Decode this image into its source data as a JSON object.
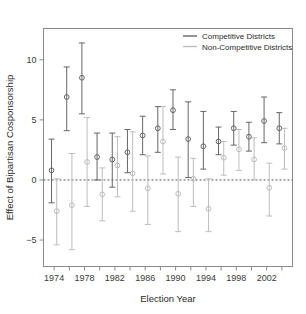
{
  "chart_data": {
    "type": "scatter",
    "title": "",
    "xlabel": "Election Year",
    "ylabel": "Effect of Bipartisan Cosponsorship",
    "xlim": [
      1972.6,
      2005.4
    ],
    "ylim": [
      -7.2,
      12.6
    ],
    "xticks": [
      1974,
      1976,
      1978,
      1980,
      1982,
      1984,
      1986,
      1988,
      1990,
      1992,
      1994,
      1996,
      1998,
      2000,
      2002,
      2004
    ],
    "xtick_labels": [
      "1974",
      "",
      "1978",
      "",
      "1982",
      "",
      "1986",
      "",
      "1990",
      "",
      "1994",
      "",
      "1998",
      "",
      "2002",
      ""
    ],
    "yticks": [
      -5,
      0,
      5,
      10
    ],
    "ytick_labels": [
      "-5",
      "0",
      "5",
      "10"
    ],
    "grid": false,
    "zero_reference_line": 0,
    "legend_position": "top-right",
    "legend": [
      "Competitive Districts",
      "Non-Competitive Districts"
    ],
    "colors": {
      "competitive": "#666666",
      "noncompetitive": "#bdbdbd",
      "axis": "#8a8a8a",
      "zero_line": "#555555",
      "text": "#2b2b2b"
    },
    "series": [
      {
        "name": "Competitive Districts",
        "marker": "open-circle",
        "color": "#666666",
        "x": [
          1974,
          1976,
          1978,
          1980,
          1982,
          1984,
          1986,
          1988,
          1990,
          1992,
          1994,
          1996,
          1998,
          2000,
          2002,
          2004
        ],
        "values": [
          0.8,
          6.9,
          8.5,
          1.9,
          1.7,
          2.3,
          3.7,
          4.3,
          5.8,
          3.4,
          2.8,
          3.2,
          4.3,
          3.6,
          4.9,
          4.3
        ],
        "ci_low": [
          -1.9,
          4.1,
          5.5,
          0.0,
          -0.6,
          0.6,
          2.1,
          2.3,
          4.2,
          0.2,
          0.9,
          2.1,
          2.9,
          2.4,
          3.1,
          3.0
        ],
        "ci_high": [
          3.4,
          9.4,
          11.4,
          3.9,
          3.9,
          4.2,
          5.3,
          6.1,
          7.5,
          6.5,
          5.7,
          4.4,
          5.7,
          4.8,
          6.9,
          5.6
        ]
      },
      {
        "name": "Non-Competitive Districts",
        "marker": "open-circle",
        "color": "#bdbdbd",
        "x": [
          1974,
          1976,
          1978,
          1980,
          1982,
          1984,
          1986,
          1988,
          1990,
          1992,
          1994,
          1996,
          1998,
          2000,
          2002,
          2004
        ],
        "values": [
          -2.6,
          -2.1,
          1.5,
          -1.2,
          1.2,
          0.55,
          -0.7,
          3.2,
          -1.15,
          0.1,
          -2.4,
          1.85,
          2.55,
          1.7,
          -0.65,
          2.65
        ],
        "ci_low": [
          -5.4,
          -5.8,
          -2.2,
          -3.4,
          -1.4,
          -2.6,
          -3.7,
          0.5,
          -4.3,
          -2.2,
          -4.3,
          0.4,
          0.8,
          0.0,
          -3.0,
          0.9
        ],
        "ci_high": [
          0.1,
          2.2,
          5.2,
          1.0,
          3.6,
          4.0,
          2.0,
          6.1,
          1.9,
          1.8,
          0.1,
          3.2,
          4.2,
          3.5,
          1.4,
          4.3
        ]
      }
    ]
  },
  "figure": {
    "background": "#ffffff"
  }
}
